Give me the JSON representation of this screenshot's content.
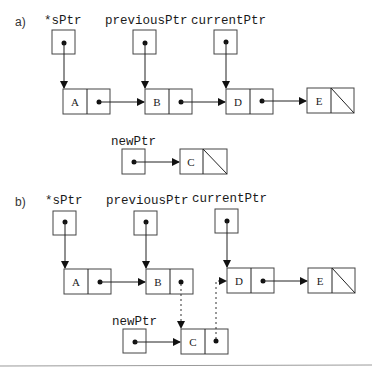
{
  "diagram": {
    "part_a": {
      "label": "a)",
      "pointers": {
        "sPtr": "*sPtr",
        "previousPtr": "previousPtr",
        "currentPtr": "currentPtr",
        "newPtr": "newPtr"
      },
      "list_nodes": [
        "A",
        "B",
        "D",
        "E"
      ],
      "new_node": "C",
      "null_terminated": [
        "E",
        "C"
      ]
    },
    "part_b": {
      "label": "b)",
      "pointers": {
        "sPtr": "*sPtr",
        "previousPtr": "previousPtr",
        "currentPtr": "currentPtr",
        "newPtr": "newPtr"
      },
      "list_nodes": [
        "A",
        "B",
        "D",
        "E"
      ],
      "new_node": "C",
      "null_terminated": [
        "E"
      ],
      "dashed_links": [
        "B -> C",
        "C -> D"
      ]
    },
    "colors": {
      "line": "#222222",
      "box_border": "#444444",
      "background": "#ffffff"
    }
  }
}
